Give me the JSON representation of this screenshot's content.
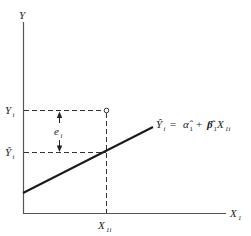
{
  "diagram": {
    "type": "regression-residual-illustration",
    "axes": {
      "y_label": "Y",
      "x_label": "X",
      "x_label_sub": "1"
    },
    "labels": {
      "observed_y": {
        "main": "Y",
        "sub": "i"
      },
      "fitted_y": {
        "main": "Ŷ",
        "sub": "i"
      },
      "residual": {
        "main": "e",
        "sub": "i"
      },
      "x_point": {
        "main": "X",
        "sub": "1i"
      }
    },
    "equation": {
      "lhs_main": "Ŷ",
      "lhs_sub": "i",
      "equals": "=",
      "alpha": "α̂",
      "alpha_sub": "1",
      "plus": "+",
      "beta": "β̂",
      "beta_sub": "1",
      "x": "X",
      "x_sub": "1i"
    },
    "colors": {
      "line": "#1a1a1a",
      "axis": "#555555",
      "dash": "#333333",
      "text": "#222222",
      "background": "#ffffff"
    }
  }
}
